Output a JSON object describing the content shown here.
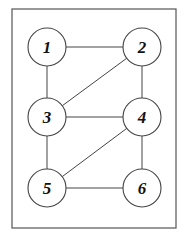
{
  "diagram": {
    "type": "undirected-graph",
    "frame": {
      "x": 12,
      "y": 9,
      "width": 164,
      "height": 219
    },
    "node_radius": 19,
    "nodes": [
      {
        "id": "1",
        "label": "1",
        "x": 47,
        "y": 47
      },
      {
        "id": "2",
        "label": "2",
        "x": 142,
        "y": 47
      },
      {
        "id": "3",
        "label": "3",
        "x": 47,
        "y": 117
      },
      {
        "id": "4",
        "label": "4",
        "x": 142,
        "y": 117
      },
      {
        "id": "5",
        "label": "5",
        "x": 47,
        "y": 188
      },
      {
        "id": "6",
        "label": "6",
        "x": 142,
        "y": 188
      }
    ],
    "edges": [
      {
        "from": "1",
        "to": "2"
      },
      {
        "from": "1",
        "to": "3"
      },
      {
        "from": "2",
        "to": "3"
      },
      {
        "from": "2",
        "to": "4"
      },
      {
        "from": "3",
        "to": "4"
      },
      {
        "from": "3",
        "to": "5"
      },
      {
        "from": "4",
        "to": "5"
      },
      {
        "from": "4",
        "to": "6"
      },
      {
        "from": "5",
        "to": "6"
      }
    ]
  }
}
